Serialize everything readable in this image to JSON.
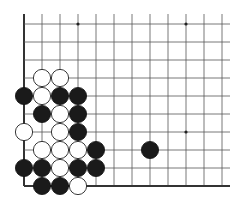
{
  "board": {
    "origin_x": 24,
    "origin_y": 24,
    "spacing": 18,
    "columns": 12,
    "rows": 10,
    "line_top_extent": 14,
    "line_right_extent": 230,
    "edges": [
      "left",
      "bottom"
    ],
    "star_points": [
      {
        "col": 3,
        "row": 0
      },
      {
        "col": 9,
        "row": 0
      },
      {
        "col": 9,
        "row": 6
      }
    ],
    "stone_radius": 8.6,
    "colors": {
      "black": "#1a1a1a",
      "white": "#ffffff",
      "line": "#555555",
      "edge": "#333333"
    }
  },
  "stones": [
    {
      "color": "white",
      "col": 1,
      "row": 3
    },
    {
      "color": "white",
      "col": 2,
      "row": 3
    },
    {
      "color": "black",
      "col": 0,
      "row": 4
    },
    {
      "color": "white",
      "col": 1,
      "row": 4
    },
    {
      "color": "black",
      "col": 2,
      "row": 4
    },
    {
      "color": "black",
      "col": 3,
      "row": 4
    },
    {
      "color": "black",
      "col": 1,
      "row": 5
    },
    {
      "color": "white",
      "col": 2,
      "row": 5
    },
    {
      "color": "black",
      "col": 3,
      "row": 5
    },
    {
      "color": "white",
      "col": 0,
      "row": 6
    },
    {
      "color": "white",
      "col": 2,
      "row": 6
    },
    {
      "color": "black",
      "col": 3,
      "row": 6
    },
    {
      "color": "white",
      "col": 1,
      "row": 7
    },
    {
      "color": "white",
      "col": 2,
      "row": 7
    },
    {
      "color": "white",
      "col": 3,
      "row": 7
    },
    {
      "color": "black",
      "col": 4,
      "row": 7
    },
    {
      "color": "black",
      "col": 7,
      "row": 7
    },
    {
      "color": "black",
      "col": 0,
      "row": 8
    },
    {
      "color": "black",
      "col": 1,
      "row": 8
    },
    {
      "color": "white",
      "col": 2,
      "row": 8
    },
    {
      "color": "black",
      "col": 3,
      "row": 8
    },
    {
      "color": "black",
      "col": 4,
      "row": 8
    },
    {
      "color": "black",
      "col": 1,
      "row": 9
    },
    {
      "color": "black",
      "col": 2,
      "row": 9
    },
    {
      "color": "white",
      "col": 3,
      "row": 9
    }
  ]
}
